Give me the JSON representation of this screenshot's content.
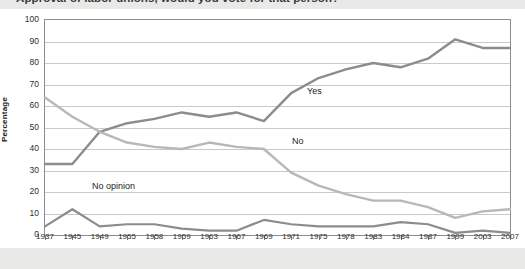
{
  "title": "Approval of labor unions, would you vote for that person?",
  "axis": {
    "ylabel": "Percentage",
    "xlabel": "Year"
  },
  "series_labels": {
    "yes": "Yes",
    "no": "No",
    "no_opinion": "No opinion"
  },
  "colors": {
    "yes_line": "#8c8c8c",
    "no_line": "#b8b8b8",
    "no_opinion_line": "#8c8c8c",
    "gridline": "#c9c9c9",
    "frame": "#8d8d8d",
    "plot_background": "#ffffff",
    "page_background": "#e9e9e7"
  },
  "chart_data": {
    "type": "line",
    "title": "Approval of labor unions, would you vote for that person?",
    "xlabel": "Year",
    "ylabel": "Percentage",
    "ylim": [
      0,
      100
    ],
    "ytick_labels": [
      "0",
      "10",
      "20",
      "30",
      "40",
      "50",
      "60",
      "70",
      "80",
      "90",
      "100"
    ],
    "yticks": [
      0,
      10,
      20,
      30,
      40,
      50,
      60,
      70,
      80,
      90,
      100
    ],
    "grid": "horizontal",
    "legend": "inline-labels",
    "categories": [
      "1937",
      "1945",
      "1949",
      "1955",
      "1958",
      "1959",
      "1963",
      "1967",
      "1969",
      "1971",
      "1975",
      "1978",
      "1983",
      "1984",
      "1987",
      "1999",
      "2003",
      "2007"
    ],
    "series": [
      {
        "name": "Yes",
        "color": "#8c8c8c",
        "values": [
          33,
          33,
          48,
          52,
          54,
          57,
          55,
          57,
          53,
          66,
          73,
          77,
          80,
          78,
          82,
          91,
          87,
          87
        ]
      },
      {
        "name": "No",
        "color": "#b8b8b8",
        "values": [
          64,
          55,
          48,
          43,
          41,
          40,
          43,
          41,
          40,
          29,
          23,
          19,
          16,
          16,
          13,
          8,
          11,
          12
        ]
      },
      {
        "name": "No opinion",
        "color": "#8c8c8c",
        "values": [
          4,
          12,
          4,
          5,
          5,
          3,
          2,
          2,
          7,
          5,
          4,
          4,
          4,
          6,
          5,
          1,
          2,
          1
        ]
      }
    ]
  }
}
